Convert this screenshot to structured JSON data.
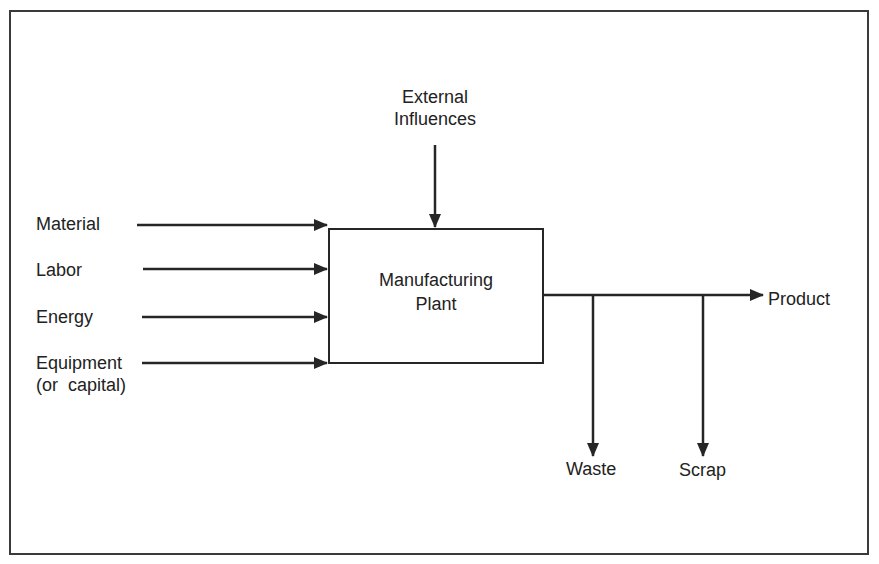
{
  "diagram": {
    "type": "flow-block-diagram",
    "central_block": {
      "label_line1": "Manufacturing",
      "label_line2": "Plant"
    },
    "top_input": {
      "label_line1": "External",
      "label_line2": "Influences"
    },
    "inputs": [
      {
        "label": "Material"
      },
      {
        "label": "Labor"
      },
      {
        "label": "Energy"
      },
      {
        "label_line1": "Equipment",
        "label_line2": "(or  capital)"
      }
    ],
    "outputs": {
      "main": {
        "label": "Product"
      },
      "branches": [
        {
          "label": "Waste"
        },
        {
          "label": "Scrap"
        }
      ]
    },
    "colors": {
      "line": "#262626",
      "text": "#222222",
      "background": "#ffffff",
      "frame": "#3a3a3a"
    }
  }
}
